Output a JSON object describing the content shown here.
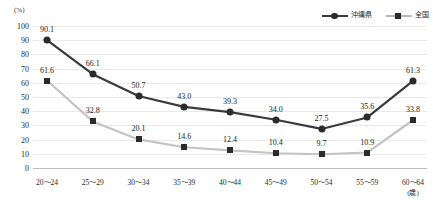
{
  "chart_data": {
    "type": "line",
    "title": "",
    "xlabel": "",
    "ylabel": "",
    "y_unit": "(%)",
    "x_unit": "(歳)",
    "ylim": [
      0,
      100
    ],
    "ytick_labels": [
      "100",
      "90",
      "80",
      "70",
      "60",
      "50",
      "40",
      "30",
      "20",
      "10",
      "0"
    ],
    "yticks": [
      100,
      90,
      80,
      70,
      60,
      50,
      40,
      30,
      20,
      10,
      0
    ],
    "grid": true,
    "legend_position": "top-right",
    "categories": [
      "20～24",
      "25～29",
      "30～34",
      "35～39",
      "40～44",
      "45～49",
      "50～54",
      "55～59",
      "60～64"
    ],
    "series": [
      {
        "name": "沖縄県",
        "color": "#3a3a3a",
        "marker": "circle",
        "values": [
          90.1,
          66.1,
          50.7,
          43.0,
          39.3,
          34.0,
          27.5,
          35.6,
          61.3
        ],
        "labels": [
          "90.1",
          "66.1",
          "50.7",
          "43.0",
          "39.3",
          "34.0",
          "27.5",
          "35.6",
          "61.3"
        ]
      },
      {
        "name": "全国",
        "color": "#c3c3c3",
        "marker": "square",
        "values": [
          61.6,
          32.8,
          20.1,
          14.6,
          12.4,
          10.4,
          9.7,
          10.9,
          33.8
        ],
        "labels": [
          "61.6",
          "32.8",
          "20.1",
          "14.6",
          "12.4",
          "10.4",
          "9.7",
          "10.9",
          "33.8"
        ]
      }
    ]
  }
}
